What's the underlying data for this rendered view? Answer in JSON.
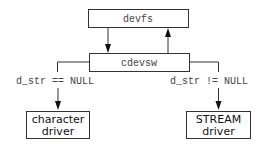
{
  "diagram": {
    "nodes": {
      "devfs": {
        "label": "devfs"
      },
      "cdevsw": {
        "label": "cdevsw"
      },
      "character_driver": {
        "line1": "character",
        "line2": "driver"
      },
      "stream_driver": {
        "line1": "STREAM",
        "line2": "driver"
      }
    },
    "edges": {
      "left_condition": "d_str == NULL",
      "right_condition": "d_str != NULL"
    },
    "colors": {
      "stroke": "#333333",
      "text": "#444444",
      "background": "#ffffff"
    }
  }
}
